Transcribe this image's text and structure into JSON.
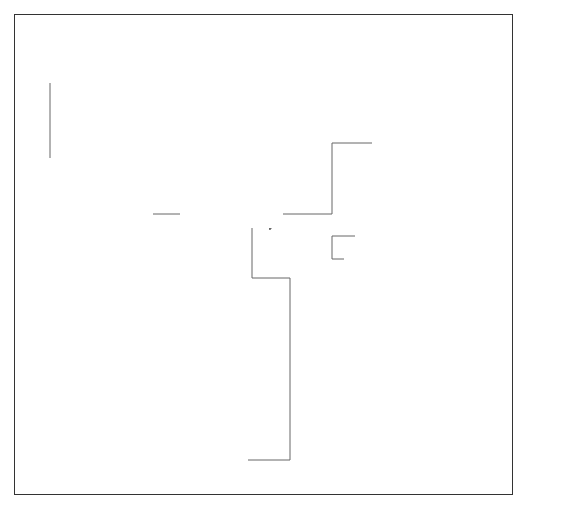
{
  "boxes": {
    "presentation_system": {
      "title": "Presentation System"
    },
    "subclass_procedure": {
      "title": "Subclass Procedure",
      "method": "_pfnwpICWinProc"
    },
    "iwindow_dispatcher": {
      "title": "IWindow Dispatcher",
      "method": "dispatch"
    },
    "ihandler": {
      "title": "IHandler",
      "method": "dispatchHandlerEvent"
    },
    "general_purpose_handler": {
      "title": "General-Purpose Handler",
      "methods": [
        "dispatchHandlerEvent",
        "virtual event-handling functions"
      ]
    },
    "application_handler": {
      "title": "Application Handler",
      "method": "virtual event-handling functions"
    },
    "notification_handler": {
      "title": "Notification Handler",
      "method": "dispatchHandlerEvent"
    },
    "previous_subclass_procedure": {
      "title": "Previous Subclass Procedure"
    }
  },
  "lists": {
    "handler_list": {
      "label": "HandlerList",
      "rows": 5
    },
    "window_list": {
      "label": "WindowList",
      "rows": 5
    }
  },
  "steps": [
    {
      "number": "1",
      "text": "Message sent to subclass procedure of Open Class Library"
    },
    {
      "number": "2",
      "text": "Convert the message to an IEvent object, and locate the IWindow object in the WindowList"
    },
    {
      "number": "3",
      "text": "Call IWindow::dispatch on the located IWindow object, passing the IEvent object"
    },
    {
      "number": "4",
      "text": "Dispatch the IEvent object to the IHandler::dispatchHandlerEvent function of each handler in the HandlerList, until one returns true"
    },
    {
      "number": "5",
      "text": "Call the event-handling function of the application's handler object"
    },
    {
      "number": "6",
      "text": "If all handlers return false, call the previous subclass procedure"
    },
    {
      "number": "7",
      "text": "If registered, call the notification handler"
    }
  ],
  "colors": {
    "stroke": "#333333",
    "wire": "#666666",
    "wire_light": "#aaaaaa",
    "arrow": "#111111"
  }
}
